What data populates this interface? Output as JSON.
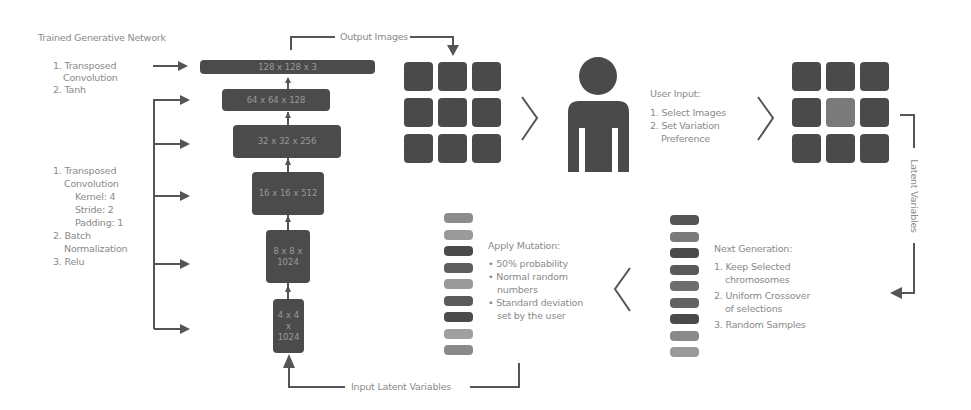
{
  "network": {
    "title": "Trained Generative Network",
    "top_steps": [
      "1. Transposed",
      "Convolution",
      "2. Tanh"
    ],
    "mid_steps": [
      "1. Transposed",
      "Convolution",
      "Kernel: 4",
      "Stride: 2",
      "Padding: 1",
      "2. Batch",
      "Normalization",
      "3. Relu"
    ],
    "layers": [
      {
        "label": "128 x 128 x 3"
      },
      {
        "label": "64 x 64 x 128"
      },
      {
        "label": "32 x 32 x 256"
      },
      {
        "label": "16 x 16 x 512"
      },
      {
        "label": "8 x 8 x\n1024"
      },
      {
        "label": "4 x 4\nx\n1024"
      }
    ]
  },
  "flow_labels": {
    "output_images": "Output Images",
    "input_latent": "Input Latent Variables",
    "latent_variables": "Latent Variables"
  },
  "user_input": {
    "title": "User Input:",
    "steps": [
      "1. Select Images",
      "2. Set Variation",
      "Preference"
    ]
  },
  "next_generation": {
    "title": "Next Generation:",
    "steps": [
      "1. Keep Selected",
      "chromosomes",
      "2. Uniform Crossover",
      "of selections",
      "3. Random Samples"
    ]
  },
  "mutation": {
    "title": "Apply Mutation:",
    "bullets": [
      "• 50% probability",
      "• Normal random",
      "numbers",
      "• Standard deviation",
      "set by the user"
    ]
  },
  "colors": {
    "dark": "#4a4a4a",
    "selected_tile": "#7a7a7a",
    "mutation_chromosomes": [
      "#8c8c8c",
      "#9a9a9a",
      "#4a4a4a",
      "#5e5e5e",
      "#9a9a9a",
      "#5a5a5a",
      "#4a4a4a",
      "#a0a0a0",
      "#8a8a8a"
    ],
    "next_gen_chromosomes": [
      "#555555",
      "#7a7a7a",
      "#4a4a4a",
      "#5a5a5a",
      "#6e6e6e",
      "#626262",
      "#4a4a4a",
      "#8a8a8a",
      "#9a9a9a"
    ]
  }
}
